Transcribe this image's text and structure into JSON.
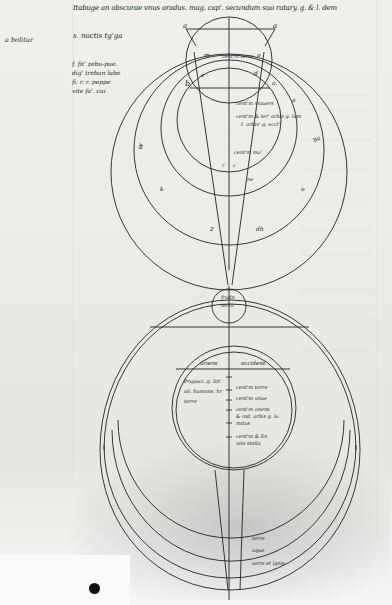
{
  "page": {
    "type": "medieval manuscript folio (grayscale photograph)",
    "background": "#efefec",
    "ink": "#1e1e1e"
  },
  "header": {
    "line1": "Itabuge an obscurae vnus oradus. mag. cap'. secundum suo rotary. g. & l. dem",
    "line2": "s. noctis tg'ga"
  },
  "margin": {
    "left_note": "a bolitur",
    "gloss_lines": [
      "f. fit' zebu-pue.",
      "dig' treban lube",
      "fi. r. r. peppe",
      "vite fa'. cui"
    ]
  },
  "upper_diagram": {
    "letters": {
      "a_left": "a",
      "a_right": "a",
      "m": "m",
      "o": "o",
      "c": "c",
      "d": "d",
      "b": "b",
      "a_inner": "a.",
      "a_right2": "a",
      "e_left": "e",
      "w": "w",
      "ba": "ba",
      "k": "k",
      "o_lower": "o",
      "z": "z",
      "dh": "dh",
      "ne": "ne",
      "r": "r",
      "c2": "c"
    },
    "labels": {
      "centrum_terre": "cent'm terre",
      "centrum_vniuersi": "cent'm vniuers",
      "centrum_line1": "cent'm & ter' orbis g. lum",
      "centrum_line2": "t. orbis' g. eccl'",
      "centrum_lower": "cent'm mo'"
    }
  },
  "lower_diagram": {
    "small_circle": {
      "line1": "frodn",
      "line2": "terra"
    },
    "horizon_left": "oriens",
    "horizon_right": "occidens",
    "left_block": [
      "Propoci. g. litt",
      "ali. humans. hr",
      "terre"
    ],
    "right_lines": [
      "cent'm terre",
      "cent'm vnue",
      "cent'm onens",
      "& ind. orbis g. lo",
      "mitus",
      "cent'm & lin",
      "vite stella"
    ],
    "arc_labels": [
      "terre",
      "aque",
      "aeris et ignis"
    ]
  }
}
